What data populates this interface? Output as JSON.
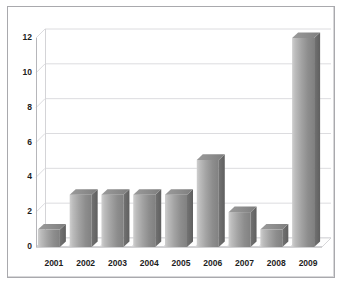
{
  "chart_data": {
    "type": "bar",
    "title": "",
    "subtitle": "",
    "xlabel": "",
    "ylabel": "",
    "categories": [
      "2001",
      "2002",
      "2003",
      "2004",
      "2005",
      "2006",
      "2007",
      "2008",
      "2009"
    ],
    "values": [
      1,
      3,
      3,
      3,
      3,
      5,
      2,
      1,
      12
    ],
    "series": [
      {
        "name": "",
        "values": [
          1,
          3,
          3,
          3,
          3,
          5,
          2,
          1,
          12
        ]
      }
    ],
    "ylim": [
      0,
      12
    ],
    "ytick_labels": [
      "0",
      "2",
      "4",
      "6",
      "8",
      "10",
      "12"
    ],
    "ytick_values": [
      0,
      2,
      4,
      6,
      8,
      10,
      12
    ],
    "grid": true,
    "grid_axis": "y",
    "legend": false,
    "legend_position": "none",
    "style": "3d-column",
    "colors": {
      "bar_light": "#c9c9c9",
      "bar_mid": "#9a9a9a",
      "bar_dark": "#7c7c7c",
      "bar_side": "#6b6b6b",
      "gridline": "#dcdcdf",
      "axis": "#b6b6ba",
      "text": "#1d1d1d",
      "background": "#ffffff",
      "frame": "#a9a9ad"
    }
  }
}
